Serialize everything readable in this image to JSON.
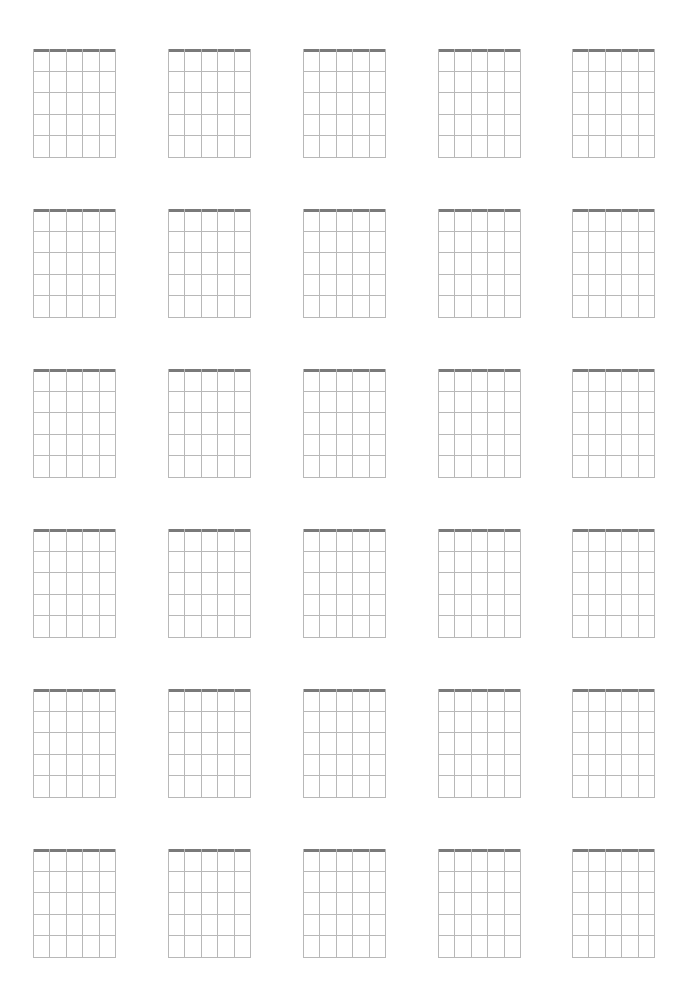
{
  "sheet": {
    "title": "",
    "type": "blank-chord-diagram-sheet",
    "rows": 6,
    "columns": 5,
    "strings_per_diagram": 6,
    "frets_per_diagram": 5,
    "colors": {
      "nut": "#7a7a7a",
      "grid": "#b8b8b8",
      "background": "#ffffff"
    },
    "column_x": [
      33,
      168,
      303,
      438,
      572
    ],
    "row_y": [
      49,
      209,
      369,
      529,
      689,
      849
    ],
    "diagram_width": 82,
    "diagram_height": 108
  }
}
